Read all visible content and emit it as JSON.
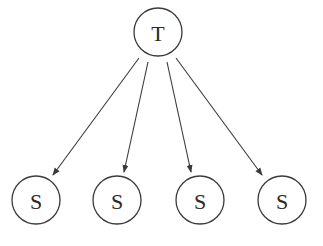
{
  "diagram": {
    "type": "tree",
    "colors": {
      "stroke": "#3a3a3a",
      "text": "#2a2a2a",
      "background": "#ffffff"
    },
    "root": {
      "id": "T",
      "label": "T",
      "cx": 158,
      "cy": 32,
      "r": 24
    },
    "children": [
      {
        "id": "S1",
        "label": "S",
        "cx": 36,
        "cy": 200,
        "r": 24
      },
      {
        "id": "S2",
        "label": "S",
        "cx": 117,
        "cy": 200,
        "r": 24
      },
      {
        "id": "S3",
        "label": "S",
        "cx": 200,
        "cy": 200,
        "r": 24
      },
      {
        "id": "S4",
        "label": "S",
        "cx": 282,
        "cy": 200,
        "r": 24
      }
    ],
    "edges": [
      {
        "from": "T",
        "to": "S1",
        "x1": 139,
        "y1": 58,
        "x2": 53,
        "y2": 175
      },
      {
        "from": "T",
        "to": "S2",
        "x1": 148,
        "y1": 62,
        "x2": 124,
        "y2": 172
      },
      {
        "from": "T",
        "to": "S3",
        "x1": 167,
        "y1": 62,
        "x2": 191,
        "y2": 172
      },
      {
        "from": "T",
        "to": "S4",
        "x1": 176,
        "y1": 58,
        "x2": 262,
        "y2": 175
      }
    ]
  }
}
